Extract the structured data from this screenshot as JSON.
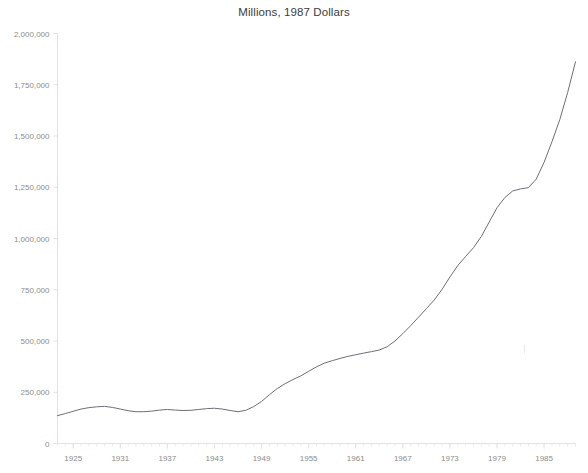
{
  "chart_data": {
    "type": "line",
    "title": "Millions, 1987 Dollars",
    "xlabel": "",
    "ylabel": "",
    "xlim": [
      1923,
      1989
    ],
    "ylim": [
      0,
      2000000
    ],
    "grid": false,
    "legend": "none",
    "y_ticks": [
      0,
      250000,
      500000,
      750000,
      1000000,
      1250000,
      1500000,
      1750000,
      2000000
    ],
    "y_tick_labels": [
      "0",
      "250,000",
      "500,000",
      "750,000",
      "1,000,000",
      "1,250,000",
      "1,500,000",
      "1,750,000",
      "2,000,000"
    ],
    "x_ticks": [
      1925,
      1931,
      1937,
      1943,
      1949,
      1955,
      1961,
      1967,
      1973,
      1979,
      1985
    ],
    "x_tick_labels": [
      "1925",
      "1931",
      "1937",
      "1943",
      "1949",
      "1955",
      "1961",
      "1967",
      "1973",
      "1979",
      "1985"
    ],
    "x_minor_tick_step": 1,
    "series": [
      {
        "name": "Millions, 1987 Dollars",
        "color": "#6e6e78",
        "x": [
          1923,
          1924,
          1925,
          1926,
          1927,
          1928,
          1929,
          1930,
          1931,
          1932,
          1933,
          1934,
          1935,
          1936,
          1937,
          1938,
          1939,
          1940,
          1941,
          1942,
          1943,
          1944,
          1945,
          1946,
          1947,
          1948,
          1949,
          1950,
          1951,
          1952,
          1953,
          1954,
          1955,
          1956,
          1957,
          1958,
          1959,
          1960,
          1961,
          1962,
          1963,
          1964,
          1965,
          1966,
          1967,
          1968,
          1969,
          1970,
          1971,
          1972,
          1973,
          1974,
          1975,
          1976,
          1977,
          1978,
          1979,
          1980,
          1981,
          1982,
          1983,
          1984,
          1985,
          1986,
          1987,
          1988,
          1989
        ],
        "y": [
          136000,
          146000,
          157000,
          168000,
          175000,
          179000,
          181000,
          176000,
          168000,
          160000,
          155000,
          155000,
          158000,
          163000,
          166000,
          163000,
          161000,
          162000,
          166000,
          170000,
          172000,
          168000,
          161000,
          155000,
          162000,
          180000,
          205000,
          238000,
          268000,
          292000,
          312000,
          330000,
          352000,
          374000,
          392000,
          404000,
          415000,
          425000,
          433000,
          441000,
          448000,
          456000,
          472000,
          500000,
          536000,
          575000,
          616000,
          658000,
          700000,
          752000,
          812000,
          868000,
          912000,
          955000,
          1010000,
          1080000,
          1150000,
          1200000,
          1232000,
          1242000,
          1248000,
          1290000,
          1372000,
          1472000,
          1580000,
          1712000,
          1862000
        ]
      }
    ]
  }
}
